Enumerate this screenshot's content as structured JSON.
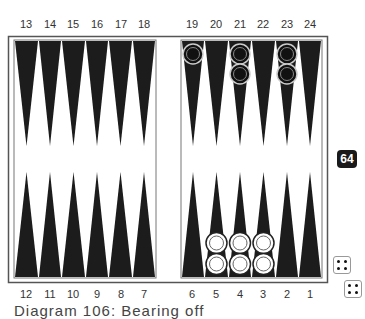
{
  "diagram": {
    "top_points": [
      "13",
      "14",
      "15",
      "16",
      "17",
      "18",
      "19",
      "20",
      "21",
      "22",
      "23",
      "24"
    ],
    "bottom_points": [
      "12",
      "11",
      "10",
      "9",
      "8",
      "7",
      "6",
      "5",
      "4",
      "3",
      "2",
      "1"
    ],
    "cube_value": "64",
    "dice": [
      4,
      4
    ],
    "caption": "Diagram 106: Bearing off",
    "checkers": {
      "black": [
        {
          "point": 19,
          "count": 1
        },
        {
          "point": 21,
          "count": 2
        },
        {
          "point": 23,
          "count": 2
        }
      ],
      "white": [
        {
          "point": 5,
          "count": 2
        },
        {
          "point": 4,
          "count": 2
        },
        {
          "point": 3,
          "count": 2
        }
      ]
    },
    "colors": {
      "triangle": "#1c1c1c",
      "frame": "#555555",
      "black_checker": "#111111",
      "white_checker": "#ffffff"
    }
  }
}
